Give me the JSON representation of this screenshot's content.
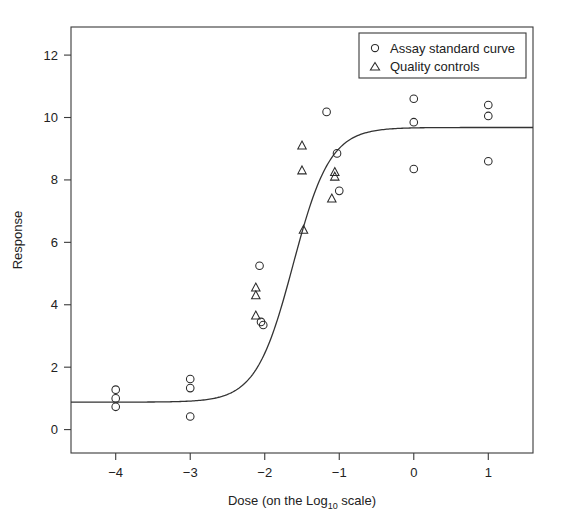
{
  "chart_data": {
    "type": "scatter",
    "title": "",
    "xlabel": "Dose (on the Log10 scale)",
    "xlabel_parts": {
      "pre": "Dose (on the Log",
      "sub": "10",
      "post": " scale)"
    },
    "ylabel": "Response",
    "xlim": [
      -4.6,
      1.6
    ],
    "ylim": [
      -0.75,
      12.9
    ],
    "xticks": [
      -4,
      -3,
      -2,
      -1,
      0,
      1
    ],
    "xticklabels": [
      "-4",
      "-3",
      "-2",
      "-1",
      "0",
      "1"
    ],
    "yticks": [
      0,
      2,
      4,
      6,
      8,
      10,
      12
    ],
    "yticklabels": [
      "0",
      "2",
      "4",
      "6",
      "8",
      "10",
      "12"
    ],
    "grid": false,
    "legend_position": "top-right",
    "series": [
      {
        "name": "Assay standard curve",
        "marker": "circle",
        "points": [
          {
            "x": -4.0,
            "y": 1.28
          },
          {
            "x": -4.0,
            "y": 1.0
          },
          {
            "x": -4.0,
            "y": 0.73
          },
          {
            "x": -3.0,
            "y": 1.62
          },
          {
            "x": -3.0,
            "y": 1.33
          },
          {
            "x": -3.0,
            "y": 0.42
          },
          {
            "x": -2.07,
            "y": 5.25
          },
          {
            "x": -2.05,
            "y": 3.45
          },
          {
            "x": -2.02,
            "y": 3.35
          },
          {
            "x": -1.03,
            "y": 8.85
          },
          {
            "x": -1.0,
            "y": 7.65
          },
          {
            "x": -1.17,
            "y": 10.18
          },
          {
            "x": 0.0,
            "y": 10.6
          },
          {
            "x": 0.0,
            "y": 9.85
          },
          {
            "x": 0.0,
            "y": 8.35
          },
          {
            "x": 1.0,
            "y": 10.4
          },
          {
            "x": 1.0,
            "y": 10.05
          },
          {
            "x": 1.0,
            "y": 8.6
          }
        ]
      },
      {
        "name": "Quality controls",
        "marker": "triangle",
        "points": [
          {
            "x": -2.12,
            "y": 4.55
          },
          {
            "x": -2.12,
            "y": 4.3
          },
          {
            "x": -2.12,
            "y": 3.65
          },
          {
            "x": -1.5,
            "y": 9.1
          },
          {
            "x": -1.5,
            "y": 8.3
          },
          {
            "x": -1.48,
            "y": 6.4
          },
          {
            "x": -1.06,
            "y": 8.25
          },
          {
            "x": -1.06,
            "y": 8.1
          },
          {
            "x": -1.1,
            "y": 7.4
          }
        ]
      }
    ],
    "fit_curve": {
      "name": "four-parameter logistic fit",
      "lower_asymptote": 0.88,
      "upper_asymptote": 9.68,
      "ed50": -1.62,
      "slope": 1.75
    }
  },
  "legend": {
    "entries": [
      {
        "marker": "circle",
        "label": "Assay standard curve"
      },
      {
        "marker": "triangle",
        "label": "Quality controls"
      }
    ]
  },
  "colors": {
    "background": "#ffffff",
    "axis": "#3a3a3a",
    "curve": "#333333",
    "marker": "#2b2b2b",
    "text": "#222222"
  }
}
